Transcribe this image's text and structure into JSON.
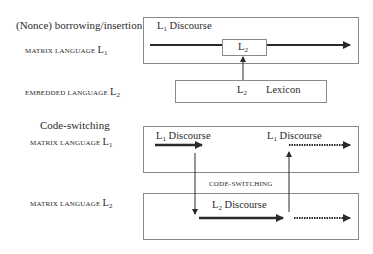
{
  "diagram": {
    "section1": {
      "heading": "(Nonce) borrowing/insertion",
      "matrix_label": {
        "prefix": "matrix language ",
        "L": "L",
        "sub": "1"
      },
      "embedded_label": {
        "prefix": "embedded language ",
        "L": "L",
        "sub": "2"
      },
      "discourse_box": {
        "label_L": "L",
        "label_sub": "1",
        "label_text": " Discourse"
      },
      "insert_box": {
        "L": "L",
        "sub": "2"
      },
      "lexicon_box": {
        "L": "L",
        "sub": "2",
        "text": "Lexicon"
      }
    },
    "section2": {
      "heading": "Code-switching",
      "matrix1_label": {
        "prefix": "matrix language ",
        "L": "L",
        "sub": "1"
      },
      "matrix2_label": {
        "prefix": "matrix language ",
        "L": "L",
        "sub": "2"
      },
      "top_box": {
        "left_label": {
          "L": "L",
          "sub": "1",
          "text": " Discourse"
        },
        "right_label": {
          "L": "L",
          "sub": "1",
          "text": " Discourse"
        }
      },
      "switch_label": "code-switching",
      "bottom_box": {
        "label": {
          "L": "L",
          "sub": "2",
          "text": " Discourse"
        }
      }
    },
    "colors": {
      "line": "#2a2a2a",
      "border": "#8a8a8a",
      "background": "#ffffff"
    }
  }
}
